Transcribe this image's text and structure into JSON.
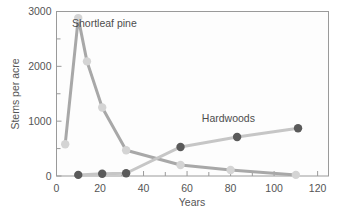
{
  "chart_data": {
    "type": "line",
    "title": "",
    "subtitle": "",
    "xlabel": "Years",
    "ylabel": "Stems per acre",
    "xlim": [
      0,
      125
    ],
    "ylim": [
      0,
      3000
    ],
    "xticks": [
      0,
      20,
      40,
      60,
      80,
      100,
      120
    ],
    "xtick_labels": [
      "0",
      "20",
      "40",
      "60",
      "80",
      "100",
      "120"
    ],
    "xminor_ticks": [
      10,
      30,
      50,
      70,
      90,
      110
    ],
    "yticks": [
      0,
      1000,
      2000,
      3000
    ],
    "ytick_labels": [
      "0",
      "1000",
      "2000",
      "3000"
    ],
    "yminor_ticks": [
      500,
      1500,
      2500
    ],
    "grid": false,
    "legend_position": "inline-annotations",
    "series": [
      {
        "name": "Shortleaf pine",
        "color": "#a8a8a8",
        "marker_color": "#d4d4d4",
        "annotation": "Shortleaf pine",
        "annotation_x": 22,
        "annotation_y": 2720,
        "x": [
          4,
          10,
          14,
          21,
          32,
          57,
          80,
          110
        ],
        "y": [
          580,
          2880,
          2090,
          1250,
          470,
          200,
          110,
          20
        ]
      },
      {
        "name": "Hardwoods",
        "color": "#c6c6c6",
        "marker_color": "#5a5a5a",
        "annotation": "Hardwoods",
        "annotation_x": 79,
        "annotation_y": 980,
        "x": [
          10,
          21,
          32,
          57,
          83,
          111
        ],
        "y": [
          20,
          40,
          50,
          530,
          710,
          870
        ]
      }
    ]
  },
  "axes": {
    "x_axis_label": "Years",
    "y_axis_label": "Stems per acre"
  },
  "colors": {
    "background": "#ffffff",
    "frame": "#9a9a9a",
    "text": "#555555",
    "pine_line": "#a8a8a8",
    "pine_marker": "#d4d4d4",
    "hardwood_line": "#c6c6c6",
    "hardwood_marker": "#5a5a5a"
  }
}
